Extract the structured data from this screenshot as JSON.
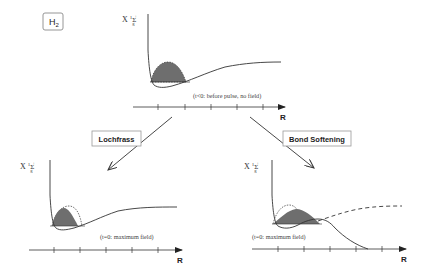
{
  "title": {
    "molecule": "H",
    "molecule_subscript": "2"
  },
  "state_label": {
    "prefix": "X",
    "multiplicity": "1",
    "symbol": "Σ",
    "subscript": "g",
    "superscript": "+"
  },
  "panels": {
    "top": {
      "caption": "(t<0: before pulse, no field)",
      "axis_label": "R"
    },
    "bottom_left": {
      "caption": "(t=0: maximum field)",
      "axis_label": "R"
    },
    "bottom_right": {
      "caption": "(t=0: maximum field)",
      "axis_label": "R"
    }
  },
  "labels": {
    "lochfrass": "Lochfrass",
    "bond_softening": "Bond Softening"
  },
  "colors": {
    "line": "#333333",
    "fill": "#6e6e6e",
    "box_border": "#9a9a9a"
  }
}
